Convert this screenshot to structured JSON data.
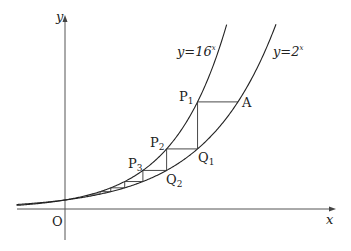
{
  "diagram": {
    "axes": {
      "x_label": "x",
      "y_label": "y",
      "origin_label": "O"
    },
    "curves": [
      {
        "id": "steep",
        "label_prefix": "y=16",
        "label_exponent": "x",
        "description": "y = 16^x"
      },
      {
        "id": "shallow",
        "label_prefix": "y=2",
        "label_exponent": "x",
        "description": "y = 2^x"
      }
    ],
    "points": [
      {
        "name": "A",
        "base": "A",
        "sub": ""
      },
      {
        "name": "P1",
        "base": "P",
        "sub": "1"
      },
      {
        "name": "Q1",
        "base": "Q",
        "sub": "1"
      },
      {
        "name": "P2",
        "base": "P",
        "sub": "2"
      },
      {
        "name": "Q2",
        "base": "Q",
        "sub": "2"
      },
      {
        "name": "P3",
        "base": "P",
        "sub": "3"
      }
    ],
    "colors": {
      "curve": "#222222",
      "axis": "#555555",
      "background": "#ffffff"
    }
  }
}
